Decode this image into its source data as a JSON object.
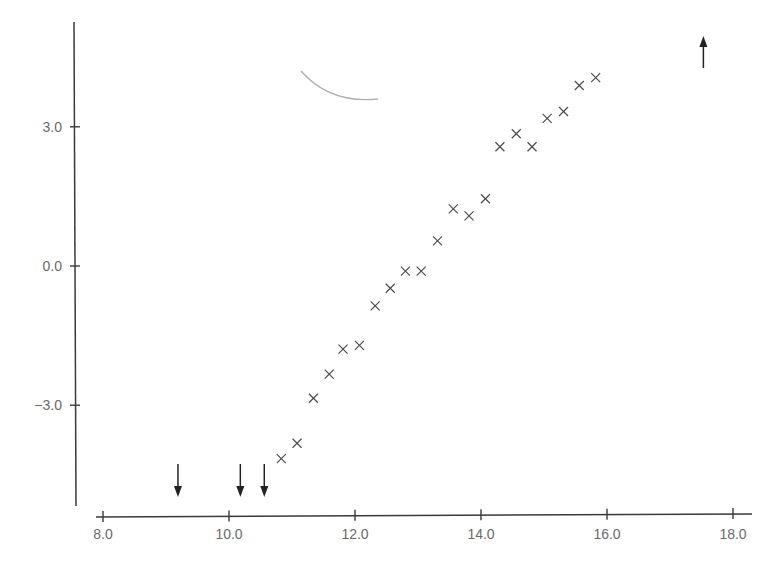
{
  "chart_data": {
    "type": "scatter",
    "title": "",
    "xlabel": "",
    "ylabel": "",
    "xlim": [
      7.8,
      18.3
    ],
    "ylim": [
      -5.4,
      5.3
    ],
    "grid": false,
    "legend": null,
    "x_ticks": [
      8.0,
      10.0,
      12.0,
      14.0,
      16.0,
      18.0
    ],
    "x_tick_labels": [
      "8.0",
      "10.0",
      "12.0",
      "14.0",
      "16.0",
      "18.0"
    ],
    "y_ticks": [
      3.0,
      0.0,
      -3.0
    ],
    "y_tick_labels": [
      "3.0",
      "0.0",
      "−3.0"
    ],
    "marker": "x",
    "series": [
      {
        "name": "data",
        "x": [
          10.83,
          11.08,
          11.34,
          11.59,
          11.81,
          12.07,
          12.32,
          12.56,
          12.8,
          13.05,
          13.31,
          13.56,
          13.81,
          14.07,
          14.3,
          14.56,
          14.81,
          15.05,
          15.31,
          15.56,
          15.82
        ],
        "y": [
          -4.15,
          -3.82,
          -2.85,
          -2.33,
          -1.79,
          -1.71,
          -0.86,
          -0.48,
          -0.11,
          -0.11,
          0.54,
          1.23,
          1.08,
          1.45,
          2.57,
          2.85,
          2.57,
          3.18,
          3.33,
          3.89,
          4.06
        ]
      }
    ],
    "annotations": {
      "down_arrows_x": [
        9.19,
        10.18,
        10.56
      ],
      "up_arrows_x": [
        17.53
      ],
      "arc": "faint gray curved arc near x≈11.5–12.4, y≈4.2–3.6"
    }
  },
  "colors": {
    "axis": "#3a3a3a",
    "tick_label": "#6a6a6a",
    "marker": "#4a4a4a",
    "arrow": "#222222",
    "arc": "#b0b0b0"
  }
}
